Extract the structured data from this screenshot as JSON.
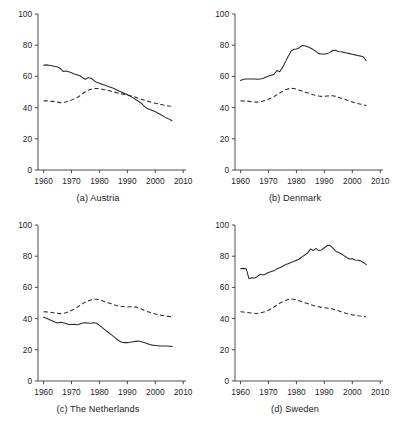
{
  "figure": {
    "panel_count": 4,
    "axis": {
      "y_ticks": [
        0,
        20,
        40,
        60,
        80,
        100
      ],
      "x_ticks": [
        1960,
        1970,
        1980,
        1990,
        2000,
        2010
      ],
      "ylim": [
        0,
        100
      ],
      "xlim": [
        1958,
        2011
      ],
      "grid": false,
      "legend": "none"
    }
  },
  "panels": [
    {
      "id": "austria",
      "caption": "(a) Austria",
      "position": "top-left"
    },
    {
      "id": "denmark",
      "caption": "(b) Denmark",
      "position": "top-right"
    },
    {
      "id": "netherlands",
      "caption": "(c) The Netherlands",
      "position": "bottom-left"
    },
    {
      "id": "sweden",
      "caption": "(d) Sweden",
      "position": "bottom-right"
    }
  ],
  "chart_data": [
    {
      "type": "line",
      "title": "(a) Austria",
      "xlabel": "",
      "ylabel": "",
      "xlim": [
        1958,
        2011
      ],
      "ylim": [
        0,
        100
      ],
      "xticks": [
        1960,
        1970,
        1980,
        1990,
        2000,
        2010
      ],
      "yticks": [
        0,
        20,
        40,
        60,
        80,
        100
      ],
      "grid": false,
      "legend_position": "none",
      "series": [
        {
          "name": "solid-series",
          "style": "solid",
          "x": [
            1960,
            1961,
            1962,
            1963,
            1964,
            1965,
            1966,
            1967,
            1968,
            1969,
            1970,
            1971,
            1972,
            1973,
            1974,
            1975,
            1976,
            1977,
            1978,
            1979,
            1980,
            1981,
            1982,
            1983,
            1984,
            1985,
            1986,
            1987,
            1988,
            1989,
            1990,
            1991,
            1992,
            1993,
            1994,
            1995,
            1996,
            1997,
            1998,
            1999,
            2000,
            2001,
            2002,
            2003,
            2004,
            2005,
            2006
          ],
          "values": [
            67.2,
            67.4,
            67.1,
            66.8,
            66.4,
            66.0,
            65.1,
            63.2,
            63.4,
            63.0,
            62.4,
            61.6,
            61.0,
            60.4,
            59.0,
            58.2,
            59.2,
            58.8,
            57.4,
            56.2,
            55.6,
            55.0,
            54.3,
            53.6,
            53.0,
            52.4,
            51.5,
            50.6,
            49.8,
            49.0,
            48.2,
            47.4,
            46.4,
            45.2,
            44.0,
            42.8,
            41.0,
            39.6,
            38.8,
            38.2,
            37.4,
            36.4,
            35.4,
            34.4,
            33.4,
            32.6,
            31.6
          ]
        },
        {
          "name": "dashed-series",
          "style": "dashed",
          "x": [
            1960,
            1961,
            1962,
            1963,
            1964,
            1965,
            1966,
            1967,
            1968,
            1969,
            1970,
            1971,
            1972,
            1973,
            1974,
            1975,
            1976,
            1977,
            1978,
            1979,
            1980,
            1981,
            1982,
            1983,
            1984,
            1985,
            1986,
            1987,
            1988,
            1989,
            1990,
            1991,
            1992,
            1993,
            1994,
            1995,
            1996,
            1997,
            1998,
            1999,
            2000,
            2001,
            2002,
            2003,
            2004,
            2005,
            2006
          ],
          "values": [
            44.4,
            44.3,
            44.2,
            44.0,
            43.8,
            43.5,
            43.2,
            43.3,
            43.6,
            44.2,
            44.8,
            45.6,
            46.4,
            47.6,
            49.0,
            50.2,
            51.2,
            51.8,
            52.2,
            52.3,
            52.2,
            51.8,
            51.4,
            51.0,
            50.6,
            50.1,
            49.6,
            49.2,
            48.8,
            48.4,
            48.0,
            47.6,
            47.2,
            46.6,
            46.0,
            45.4,
            44.8,
            44.2,
            43.7,
            43.2,
            42.8,
            42.4,
            42.0,
            41.6,
            41.3,
            41.0,
            40.8
          ]
        }
      ]
    },
    {
      "type": "line",
      "title": "(b) Denmark",
      "xlabel": "",
      "ylabel": "",
      "xlim": [
        1958,
        2011
      ],
      "ylim": [
        0,
        100
      ],
      "xticks": [
        1960,
        1970,
        1980,
        1990,
        2000,
        2010
      ],
      "yticks": [
        0,
        20,
        40,
        60,
        80,
        100
      ],
      "grid": false,
      "legend_position": "none",
      "series": [
        {
          "name": "solid-series",
          "style": "solid",
          "x": [
            1960,
            1961,
            1962,
            1963,
            1964,
            1965,
            1966,
            1967,
            1968,
            1969,
            1970,
            1971,
            1972,
            1973,
            1974,
            1975,
            1976,
            1977,
            1978,
            1979,
            1980,
            1981,
            1982,
            1983,
            1984,
            1985,
            1986,
            1987,
            1988,
            1989,
            1990,
            1991,
            1992,
            1993,
            1994,
            1995,
            1996,
            1997,
            1998,
            1999,
            2000,
            2001,
            2002,
            2003,
            2004,
            2005
          ],
          "values": [
            57.4,
            58.2,
            58.4,
            58.4,
            58.4,
            58.3,
            58.2,
            58.4,
            58.6,
            59.4,
            60.2,
            60.8,
            61.4,
            63.8,
            63.0,
            65.6,
            69.0,
            72.8,
            76.0,
            77.4,
            77.6,
            78.4,
            79.8,
            79.6,
            79.0,
            78.2,
            77.2,
            76.0,
            74.6,
            74.4,
            74.4,
            74.6,
            75.4,
            76.6,
            76.8,
            76.0,
            75.8,
            75.4,
            75.0,
            74.6,
            74.2,
            73.8,
            73.4,
            73.0,
            72.4,
            70.0
          ]
        },
        {
          "name": "dashed-series",
          "style": "dashed",
          "x": [
            1960,
            1961,
            1962,
            1963,
            1964,
            1965,
            1966,
            1967,
            1968,
            1969,
            1970,
            1971,
            1972,
            1973,
            1974,
            1975,
            1976,
            1977,
            1978,
            1979,
            1980,
            1981,
            1982,
            1983,
            1984,
            1985,
            1986,
            1987,
            1988,
            1989,
            1990,
            1991,
            1992,
            1993,
            1994,
            1995,
            1996,
            1997,
            1998,
            1999,
            2000,
            2001,
            2002,
            2003,
            2004,
            2005
          ],
          "values": [
            44.3,
            44.2,
            44.1,
            44.0,
            43.8,
            43.6,
            43.5,
            43.8,
            44.2,
            44.8,
            45.4,
            46.2,
            47.0,
            48.2,
            49.4,
            50.4,
            51.4,
            52.0,
            52.4,
            52.2,
            51.8,
            51.2,
            50.6,
            50.0,
            49.4,
            48.8,
            48.2,
            47.8,
            47.4,
            47.2,
            47.2,
            47.4,
            47.6,
            47.6,
            47.2,
            46.6,
            46.0,
            45.4,
            44.8,
            44.2,
            43.6,
            43.0,
            42.6,
            42.2,
            41.8,
            41.2
          ]
        }
      ]
    },
    {
      "type": "line",
      "title": "(c) The Netherlands",
      "xlabel": "",
      "ylabel": "",
      "xlim": [
        1958,
        2011
      ],
      "ylim": [
        0,
        100
      ],
      "xticks": [
        1960,
        1970,
        1980,
        1990,
        2000,
        2010
      ],
      "yticks": [
        0,
        20,
        40,
        60,
        80,
        100
      ],
      "grid": false,
      "legend_position": "none",
      "series": [
        {
          "name": "solid-series",
          "style": "solid",
          "x": [
            1960,
            1961,
            1962,
            1963,
            1964,
            1965,
            1966,
            1967,
            1968,
            1969,
            1970,
            1971,
            1972,
            1973,
            1974,
            1975,
            1976,
            1977,
            1978,
            1979,
            1980,
            1981,
            1982,
            1983,
            1984,
            1985,
            1986,
            1987,
            1988,
            1989,
            1990,
            1991,
            1992,
            1993,
            1994,
            1995,
            1996,
            1997,
            1998,
            1999,
            2000,
            2001,
            2002,
            2003,
            2004,
            2005,
            2006
          ],
          "values": [
            40.8,
            40.2,
            39.4,
            38.6,
            37.8,
            37.2,
            37.6,
            37.4,
            36.8,
            36.2,
            36.2,
            36.4,
            36.0,
            36.6,
            37.2,
            37.4,
            37.2,
            37.0,
            37.4,
            37.0,
            35.6,
            34.2,
            32.8,
            31.4,
            30.0,
            28.6,
            27.2,
            25.8,
            24.8,
            24.6,
            24.6,
            24.8,
            25.2,
            25.4,
            25.6,
            25.2,
            24.6,
            24.0,
            23.4,
            23.0,
            22.8,
            22.6,
            22.4,
            22.4,
            22.4,
            22.3,
            22.2
          ]
        },
        {
          "name": "dashed-series",
          "style": "dashed",
          "x": [
            1960,
            1961,
            1962,
            1963,
            1964,
            1965,
            1966,
            1967,
            1968,
            1969,
            1970,
            1971,
            1972,
            1973,
            1974,
            1975,
            1976,
            1977,
            1978,
            1979,
            1980,
            1981,
            1982,
            1983,
            1984,
            1985,
            1986,
            1987,
            1988,
            1989,
            1990,
            1991,
            1992,
            1993,
            1994,
            1995,
            1996,
            1997,
            1998,
            1999,
            2000,
            2001,
            2002,
            2003,
            2004,
            2005,
            2006
          ],
          "values": [
            44.4,
            44.3,
            44.1,
            43.9,
            43.6,
            43.4,
            43.2,
            43.4,
            43.8,
            44.4,
            45.2,
            46.2,
            47.2,
            48.4,
            49.6,
            50.6,
            51.4,
            52.0,
            52.4,
            52.4,
            52.0,
            51.4,
            50.8,
            50.2,
            49.6,
            49.0,
            48.4,
            48.0,
            47.8,
            47.6,
            47.4,
            47.6,
            47.6,
            47.4,
            46.8,
            46.2,
            45.4,
            44.6,
            44.0,
            43.4,
            43.0,
            42.6,
            42.2,
            41.8,
            41.6,
            41.4,
            41.2
          ]
        }
      ]
    },
    {
      "type": "line",
      "title": "(d) Sweden",
      "xlabel": "",
      "ylabel": "",
      "xlim": [
        1958,
        2011
      ],
      "ylim": [
        0,
        100
      ],
      "xticks": [
        1960,
        1970,
        1980,
        1990,
        2000,
        2010
      ],
      "yticks": [
        0,
        20,
        40,
        60,
        80,
        100
      ],
      "grid": false,
      "legend_position": "none",
      "series": [
        {
          "name": "solid-series",
          "style": "solid",
          "x": [
            1960,
            1961,
            1962,
            1963,
            1964,
            1965,
            1966,
            1967,
            1968,
            1969,
            1970,
            1971,
            1972,
            1973,
            1974,
            1975,
            1976,
            1977,
            1978,
            1979,
            1980,
            1981,
            1982,
            1983,
            1984,
            1985,
            1986,
            1987,
            1988,
            1989,
            1990,
            1991,
            1992,
            1993,
            1994,
            1995,
            1996,
            1997,
            1998,
            1999,
            2000,
            2001,
            2002,
            2003,
            2004,
            2005
          ],
          "values": [
            72.0,
            72.2,
            72.0,
            65.6,
            66.2,
            66.0,
            67.0,
            68.4,
            68.0,
            68.6,
            69.6,
            70.2,
            70.6,
            72.0,
            72.6,
            73.4,
            74.6,
            75.2,
            76.0,
            76.6,
            77.4,
            78.2,
            79.6,
            80.8,
            82.0,
            84.6,
            83.6,
            85.0,
            83.6,
            84.0,
            85.4,
            86.8,
            87.0,
            85.4,
            83.4,
            82.4,
            81.6,
            80.4,
            79.2,
            78.2,
            78.4,
            77.6,
            77.4,
            77.0,
            76.0,
            74.6
          ]
        },
        {
          "name": "dashed-series",
          "style": "dashed",
          "x": [
            1960,
            1961,
            1962,
            1963,
            1964,
            1965,
            1966,
            1967,
            1968,
            1969,
            1970,
            1971,
            1972,
            1973,
            1974,
            1975,
            1976,
            1977,
            1978,
            1979,
            1980,
            1981,
            1982,
            1983,
            1984,
            1985,
            1986,
            1987,
            1988,
            1989,
            1990,
            1991,
            1992,
            1993,
            1994,
            1995,
            1996,
            1997,
            1998,
            1999,
            2000,
            2001,
            2002,
            2003,
            2004,
            2005
          ],
          "values": [
            44.4,
            44.2,
            44.0,
            43.8,
            43.6,
            43.4,
            43.3,
            43.6,
            44.0,
            44.6,
            45.4,
            46.4,
            47.4,
            48.6,
            49.8,
            50.8,
            51.6,
            52.2,
            52.4,
            52.4,
            52.0,
            51.4,
            50.8,
            50.2,
            49.6,
            49.0,
            48.4,
            48.0,
            47.6,
            47.2,
            47.0,
            46.8,
            46.6,
            46.2,
            45.6,
            45.0,
            44.4,
            43.8,
            43.2,
            42.8,
            42.4,
            42.2,
            41.8,
            41.6,
            41.4,
            41.0
          ]
        }
      ]
    }
  ]
}
